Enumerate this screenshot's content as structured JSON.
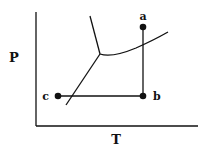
{
  "diagram": {
    "type": "phase-diagram",
    "axes": {
      "y_label": "P",
      "x_label": "T"
    },
    "points": [
      {
        "id": "a",
        "label": "a"
      },
      {
        "id": "b",
        "label": "b"
      },
      {
        "id": "c",
        "label": "c"
      }
    ],
    "paths": [
      {
        "from": "a",
        "to": "b",
        "direction": "isothermal decrease in pressure"
      },
      {
        "from": "b",
        "to": "c",
        "direction": "isobaric decrease in temperature"
      }
    ],
    "phase_boundaries": [
      "solid-liquid",
      "liquid-gas",
      "solid-gas"
    ],
    "colors": {
      "ink": "#111111",
      "background": "#ffffff"
    }
  }
}
